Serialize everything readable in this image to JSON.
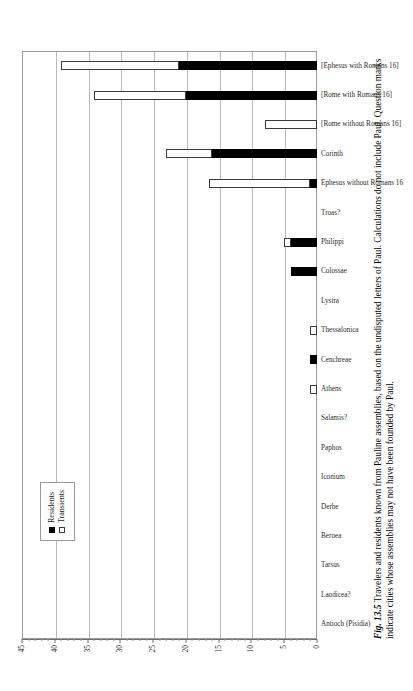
{
  "figure": {
    "number_label": "Fig. 13.5",
    "caption": "Travelers and residents known from Pauline assemblies, based on the undisputed letters of Paul. Calculations do not include Paul. Question marks indicate cities whose assemblies may not have been founded by Paul."
  },
  "legend": {
    "position": "inside-top-left",
    "items": [
      {
        "label": "Residents",
        "swatch": "filled-black-square"
      },
      {
        "label": "Transients",
        "swatch": "open-white-square"
      }
    ]
  },
  "axis": {
    "ticks": [
      "0",
      "5",
      "10",
      "15",
      "20",
      "25",
      "30",
      "35",
      "40",
      "45"
    ],
    "min": 0,
    "max": 45,
    "step": 5
  },
  "chart_data": {
    "type": "bar",
    "title": "",
    "subtitle": "",
    "xlabel": "",
    "ylabel": "",
    "ylim": [
      0,
      45
    ],
    "grid": true,
    "stacked": true,
    "orientation": "vertical-bars-on-rotated-page",
    "legend_position": "inside-top-left",
    "categories": [
      "Antioch (Pisidia)",
      "Laodicea?",
      "Tarsus",
      "Beroea",
      "Derbe",
      "Iconium",
      "Paphos",
      "Salamis?",
      "Athens",
      "Cenchreae",
      "Thessalonica",
      "Lystra",
      "Colossae",
      "Philippi",
      "Troas?",
      "Ephesus without Romans 16",
      "Corinth",
      "[Rome without Romans 16]",
      "[Rome with Romans 16]",
      "[Ephesus with Romans 16]"
    ],
    "series": [
      {
        "name": "Residents",
        "color": "#000000",
        "values": [
          0,
          0,
          0,
          0,
          0,
          0,
          0,
          0,
          0,
          1,
          0,
          0,
          4,
          4,
          0,
          1,
          16,
          0,
          20,
          21
        ]
      },
      {
        "name": "Transients",
        "color": "#ffffff",
        "values": [
          0,
          0,
          0,
          0,
          0,
          0,
          0,
          0,
          1,
          0,
          1,
          0,
          0,
          1,
          0,
          15.5,
          7,
          8,
          14,
          18
        ]
      }
    ],
    "totals": [
      0,
      0,
      0,
      0,
      0,
      0,
      0,
      0,
      1,
      1,
      1,
      0,
      4,
      5,
      0,
      16.5,
      23,
      8,
      34,
      39
    ]
  }
}
